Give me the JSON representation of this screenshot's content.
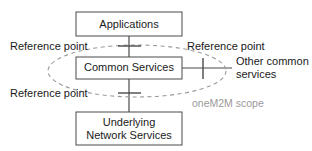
{
  "diagram": {
    "boxes": [
      {
        "id": "applications",
        "label": "Applications",
        "lines": [
          "Applications"
        ]
      },
      {
        "id": "common-services",
        "label": "Common Services",
        "lines": [
          "Common Services"
        ]
      },
      {
        "id": "underlying-network-services",
        "label": "Underlying Network Services",
        "lines": [
          "Underlying",
          "Network Services"
        ]
      }
    ],
    "labels": {
      "reference_point_top_left": "Reference point",
      "reference_point_top_right": "Reference point",
      "reference_point_bottom_left": "Reference point",
      "other_common_services_line1": "Other common",
      "other_common_services_line2": "services",
      "scope": "oneM2M scope"
    },
    "colors": {
      "box_stroke": "#4a4a4a",
      "box_fill": "#ffffff",
      "text": "#1a1a1a",
      "scope_stroke": "#9a9a9a",
      "scope_text": "#9a9a9a",
      "background": "#ffffff"
    },
    "geometry": {
      "canvas": {
        "width": 312,
        "height": 151
      },
      "applications_box": {
        "x": 76,
        "y": 12,
        "width": 106,
        "height": 24
      },
      "common_services_box": {
        "x": 76,
        "y": 57,
        "width": 106,
        "height": 22
      },
      "underlying_box": {
        "x": 76,
        "y": 112,
        "width": 106,
        "height": 33
      },
      "scope_ellipse": {
        "cx": 137,
        "cy": 71,
        "rx": 89,
        "ry": 26
      },
      "reference_point_ticks": [
        {
          "id": "rp-top",
          "x": 129,
          "y": 46
        },
        {
          "id": "rp-bottom",
          "x": 129,
          "y": 93
        },
        {
          "id": "rp-right",
          "x": 203,
          "y": 68
        }
      ]
    }
  }
}
